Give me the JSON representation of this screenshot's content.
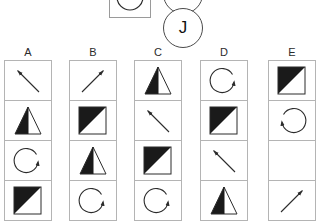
{
  "prompt": {
    "box_glyph": "circle-arc",
    "bubbles": [
      {
        "label": "G",
        "name": "bubble-letter-g"
      },
      {
        "label": "J",
        "name": "bubble-letter-j"
      }
    ]
  },
  "colors": {
    "fill": "#1a1a1a",
    "stroke": "#2b2b2b",
    "grid_line": "#b4b4b4",
    "background": "#ffffff"
  },
  "columns": [
    {
      "header": "A",
      "cells": [
        {
          "shape": "arrow-up-left",
          "label": "diagonal arrow pointing up-left"
        },
        {
          "shape": "triangle-left-filled",
          "label": "triangle with left half filled"
        },
        {
          "shape": "circular-arrow-right",
          "label": "circular arrow, head at right"
        },
        {
          "shape": "square-upper-left-filled",
          "label": "square with upper-left triangle filled"
        }
      ]
    },
    {
      "header": "B",
      "cells": [
        {
          "shape": "arrow-up-right",
          "label": "diagonal arrow pointing up-right"
        },
        {
          "shape": "square-upper-left-filled",
          "label": "square with upper-left triangle filled"
        },
        {
          "shape": "triangle-left-filled",
          "label": "triangle with left half filled"
        },
        {
          "shape": "circular-arrow-right",
          "label": "circular arrow, head at right"
        }
      ]
    },
    {
      "header": "C",
      "cells": [
        {
          "shape": "triangle-left-filled",
          "label": "triangle with left half filled"
        },
        {
          "shape": "arrow-up-left",
          "label": "diagonal arrow pointing up-left"
        },
        {
          "shape": "square-upper-left-filled",
          "label": "square with upper-left triangle filled"
        },
        {
          "shape": "circular-arrow-right",
          "label": "circular arrow, head at right"
        }
      ]
    },
    {
      "header": "D",
      "cells": [
        {
          "shape": "circular-arrow-right",
          "label": "circular arrow, head at right"
        },
        {
          "shape": "square-upper-left-filled",
          "label": "square with upper-left triangle filled"
        },
        {
          "shape": "arrow-up-left",
          "label": "diagonal arrow pointing up-left"
        },
        {
          "shape": "triangle-left-filled",
          "label": "triangle with left half filled"
        }
      ]
    },
    {
      "header": "E",
      "cells": [
        {
          "shape": "square-upper-left-filled",
          "label": "square with upper-left triangle filled"
        },
        {
          "shape": "circular-arrow-left",
          "label": "circular arrow, head at left"
        },
        {
          "shape": "empty",
          "label": "empty cell"
        },
        {
          "shape": "arrow-up-right",
          "label": "diagonal arrow pointing up-right"
        }
      ]
    }
  ]
}
